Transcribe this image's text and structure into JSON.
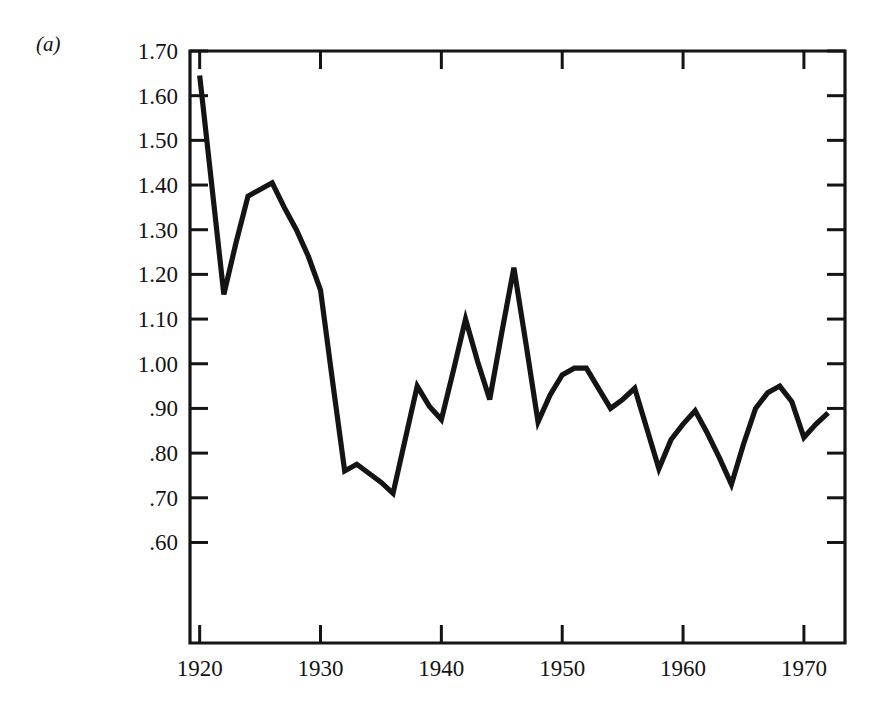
{
  "figure": {
    "panel_label": "(a)",
    "background_color": "#ffffff",
    "line_color": "#141414",
    "axis_color": "#141414"
  },
  "chart_data": {
    "type": "line",
    "title": "",
    "subtitle": "",
    "xlabel": "",
    "ylabel": "",
    "grid": false,
    "legend": "none",
    "xlim": [
      1919.2,
      1973.4
    ],
    "ylim": [
      0.375,
      1.7
    ],
    "xticks": [
      1920,
      1930,
      1940,
      1950,
      1960,
      1970
    ],
    "xtick_labels": [
      "1920",
      "1930",
      "1940",
      "1950",
      "1960",
      "1970"
    ],
    "yticks": [
      0.6,
      0.7,
      0.8,
      0.9,
      1.0,
      1.1,
      1.2,
      1.3,
      1.4,
      1.5,
      1.6,
      1.7
    ],
    "ytick_labels": [
      ".60",
      ".70",
      ".80",
      ".90",
      "1.00",
      "1.10",
      "1.20",
      "1.30",
      "1.40",
      "1.50",
      "1.60",
      "1.70"
    ],
    "series": [
      {
        "name": "series-a",
        "x": [
          1920,
          1921,
          1922,
          1923,
          1924,
          1925,
          1926,
          1927,
          1928,
          1929,
          1930,
          1931,
          1932,
          1933,
          1934,
          1935,
          1936,
          1937,
          1938,
          1939,
          1940,
          1941,
          1942,
          1943,
          1944,
          1945,
          1946,
          1947,
          1948,
          1949,
          1950,
          1951,
          1952,
          1953,
          1954,
          1955,
          1956,
          1957,
          1958,
          1959,
          1960,
          1961,
          1962,
          1963,
          1964,
          1965,
          1966,
          1967,
          1968,
          1969,
          1970,
          1971,
          1972
        ],
        "values": [
          1.645,
          1.4,
          1.155,
          1.27,
          1.375,
          1.39,
          1.405,
          1.35,
          1.3,
          1.24,
          1.165,
          0.96,
          0.76,
          0.775,
          0.755,
          0.735,
          0.71,
          0.83,
          0.95,
          0.905,
          0.875,
          0.985,
          1.1,
          1.005,
          0.92,
          1.07,
          1.215,
          1.045,
          0.87,
          0.93,
          0.975,
          0.99,
          0.99,
          0.945,
          0.9,
          0.92,
          0.945,
          0.855,
          0.765,
          0.83,
          0.865,
          0.895,
          0.845,
          0.79,
          0.73,
          0.82,
          0.9,
          0.935,
          0.95,
          0.915,
          0.835,
          0.865,
          0.89
        ]
      }
    ]
  }
}
